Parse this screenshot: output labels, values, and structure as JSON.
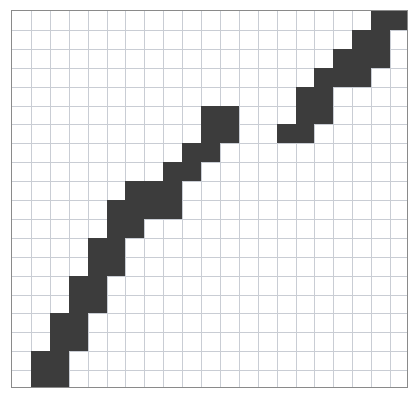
{
  "figure": {
    "background_color": "#ffffff",
    "border_color": "#8a8a8a",
    "grid_line_color": "#c9cdd4",
    "shape_fill_color": "#3c3c3c"
  },
  "chart_data": {
    "type": "heatmap",
    "xlabel": "",
    "ylabel": "",
    "grid": true,
    "legend": "none",
    "columns": 21,
    "rows": 20,
    "cell_width": 18.9,
    "cell_height": 18.9,
    "xlim": [
      0,
      21
    ],
    "ylim": [
      0,
      20
    ],
    "xticklabels": [],
    "yticklabels": [],
    "note": "Filled cells are given as [column, row] pairs with column 0 at the left edge and row 0 at the top edge.",
    "series": [
      {
        "name": "segment-bottom-left",
        "values": [
          [
            1,
            19
          ],
          [
            2,
            19
          ],
          [
            1,
            18
          ],
          [
            2,
            18
          ],
          [
            2,
            17
          ],
          [
            3,
            17
          ],
          [
            2,
            16
          ],
          [
            3,
            16
          ],
          [
            3,
            15
          ],
          [
            4,
            15
          ],
          [
            3,
            14
          ],
          [
            4,
            14
          ],
          [
            4,
            13
          ],
          [
            5,
            13
          ],
          [
            4,
            12
          ],
          [
            5,
            12
          ],
          [
            5,
            11
          ],
          [
            5,
            10
          ],
          [
            6,
            10
          ],
          [
            6,
            9
          ]
        ]
      },
      {
        "name": "segment-middle",
        "values": [
          [
            6,
            11
          ],
          [
            7,
            10
          ],
          [
            8,
            10
          ],
          [
            7,
            9
          ],
          [
            8,
            9
          ],
          [
            8,
            8
          ],
          [
            9,
            8
          ],
          [
            9,
            7
          ],
          [
            10,
            7
          ],
          [
            10,
            6
          ],
          [
            11,
            6
          ],
          [
            10,
            5
          ],
          [
            11,
            5
          ]
        ]
      },
      {
        "name": "segment-top-right",
        "values": [
          [
            14,
            6
          ],
          [
            15,
            6
          ],
          [
            15,
            5
          ],
          [
            16,
            5
          ],
          [
            15,
            4
          ],
          [
            16,
            4
          ],
          [
            16,
            3
          ],
          [
            17,
            3
          ],
          [
            18,
            3
          ],
          [
            17,
            2
          ],
          [
            18,
            2
          ],
          [
            19,
            2
          ],
          [
            18,
            1
          ],
          [
            19,
            1
          ],
          [
            19,
            0
          ],
          [
            20,
            0
          ]
        ]
      }
    ]
  }
}
